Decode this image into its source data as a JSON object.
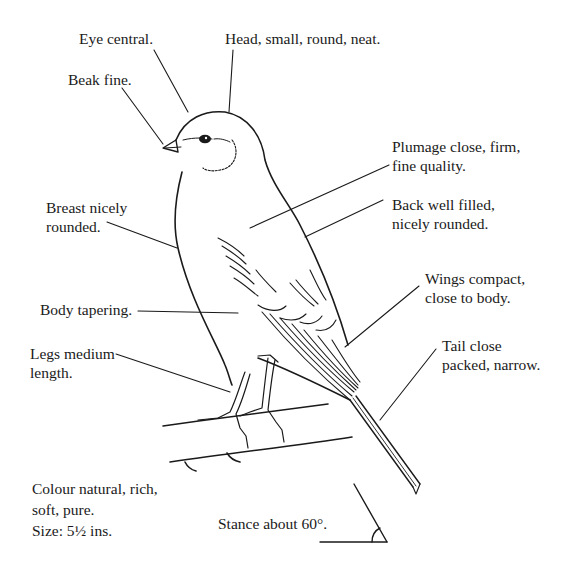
{
  "figure": {
    "labels": {
      "eye": {
        "lines": [
          "Eye central."
        ],
        "x": 79,
        "y": 29
      },
      "head": {
        "lines": [
          "Head, small, round, neat."
        ],
        "x": 225,
        "y": 29
      },
      "beak": {
        "lines": [
          "Beak fine."
        ],
        "x": 68,
        "y": 70
      },
      "plumage": {
        "lines": [
          "Plumage close, firm,",
          "fine quality."
        ],
        "x": 392,
        "y": 137
      },
      "back": {
        "lines": [
          "Back well filled,",
          "nicely rounded."
        ],
        "x": 392,
        "y": 195
      },
      "breast": {
        "lines": [
          "Breast nicely",
          "rounded."
        ],
        "x": 46,
        "y": 198
      },
      "body": {
        "lines": [
          "Body tapering."
        ],
        "x": 40,
        "y": 300
      },
      "wings": {
        "lines": [
          "Wings compact,",
          "close to body."
        ],
        "x": 425,
        "y": 269
      },
      "legs": {
        "lines": [
          "Legs medium",
          "length."
        ],
        "x": 30,
        "y": 344
      },
      "tail": {
        "lines": [
          "Tail close",
          "packed, narrow."
        ],
        "x": 442,
        "y": 336
      },
      "colour": {
        "lines": [
          "Colour natural, rich,",
          "soft, pure.",
          "Size: 5½ ins."
        ],
        "x": 32,
        "y": 478
      },
      "stance": {
        "lines": [
          "Stance about 60°."
        ],
        "x": 218,
        "y": 514
      }
    },
    "colors": {
      "ink": "#1a1a1a",
      "background": "#ffffff"
    }
  }
}
